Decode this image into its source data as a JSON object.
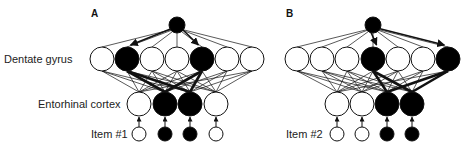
{
  "figure": {
    "colors": {
      "active": "#000000",
      "inactive": "#ffffff",
      "stroke": "#111111"
    },
    "row_labels": {
      "dentate_gyrus": "Dentate gyrus",
      "entorhinal_cortex": "Entorhinal cortex"
    },
    "panels": [
      {
        "id": "A",
        "label": "A",
        "label_pos": [
          96,
          16
        ],
        "item_label": "Item #1",
        "item_label_pos": [
          91,
          138
        ],
        "top_node": {
          "x": 177,
          "y": 25,
          "r": 8,
          "active": true
        },
        "dentate_gyrus": {
          "y": 59,
          "r": 12,
          "nodes": [
            {
              "x": 102,
              "active": false
            },
            {
              "x": 127,
              "active": true
            },
            {
              "x": 152,
              "active": false
            },
            {
              "x": 177,
              "active": false
            },
            {
              "x": 202,
              "active": true
            },
            {
              "x": 227,
              "active": false
            },
            {
              "x": 252,
              "active": false
            }
          ]
        },
        "entorhinal_cortex": {
          "y": 104,
          "r": 12,
          "nodes": [
            {
              "x": 139,
              "active": false
            },
            {
              "x": 165,
              "active": true
            },
            {
              "x": 190,
              "active": true
            },
            {
              "x": 216,
              "active": false
            }
          ]
        },
        "item": {
          "y": 134,
          "r": 7,
          "nodes": [
            {
              "x": 139,
              "active": false
            },
            {
              "x": 165,
              "active": true
            },
            {
              "x": 190,
              "active": true
            },
            {
              "x": 216,
              "active": false
            }
          ]
        }
      },
      {
        "id": "B",
        "label": "B",
        "label_pos": [
          286,
          16
        ],
        "item_label": "Item #2",
        "item_label_pos": [
          286,
          138
        ],
        "top_node": {
          "x": 373,
          "y": 25,
          "r": 8,
          "active": true
        },
        "dentate_gyrus": {
          "y": 59,
          "r": 12,
          "nodes": [
            {
              "x": 297,
              "active": false
            },
            {
              "x": 322,
              "active": false
            },
            {
              "x": 347,
              "active": false
            },
            {
              "x": 373,
              "active": true
            },
            {
              "x": 398,
              "active": false
            },
            {
              "x": 423,
              "active": false
            },
            {
              "x": 448,
              "active": true
            }
          ]
        },
        "entorhinal_cortex": {
          "y": 104,
          "r": 12,
          "nodes": [
            {
              "x": 337,
              "active": false
            },
            {
              "x": 362,
              "active": false
            },
            {
              "x": 387,
              "active": true
            },
            {
              "x": 412,
              "active": true
            }
          ]
        },
        "item": {
          "y": 134,
          "r": 7,
          "nodes": [
            {
              "x": 337,
              "active": false
            },
            {
              "x": 362,
              "active": false
            },
            {
              "x": 387,
              "active": true
            },
            {
              "x": 412,
              "active": true
            }
          ]
        }
      }
    ]
  }
}
